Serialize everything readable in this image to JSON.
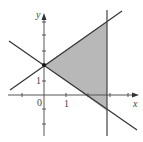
{
  "figure": {
    "type": "linear-inequality-region",
    "axes": {
      "x_label": "x",
      "y_label": "y",
      "origin_label": "0",
      "x_tick_label": "1",
      "y_tick_label": "1"
    },
    "lines": [
      {
        "name": "upper-line",
        "equation": "y = 1.5 + 0.75x"
      },
      {
        "name": "lower-line",
        "equation": "y = 1.5 - 0.75x"
      },
      {
        "name": "vertical-line",
        "equation": "x = 3"
      }
    ],
    "shaded_region": {
      "vertices": [
        [
          0,
          1.5
        ],
        [
          3,
          3.75
        ],
        [
          3,
          -0.75
        ]
      ],
      "color": "#b8b8b8"
    },
    "intersection_point": [
      0,
      1.5
    ]
  }
}
